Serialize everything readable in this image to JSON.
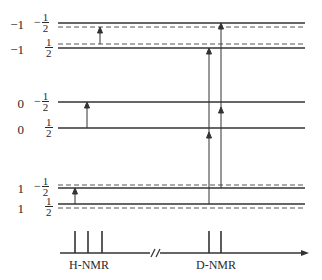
{
  "diagram": {
    "title": "",
    "levels": [
      {
        "mI": "-1",
        "mS_sign": "-",
        "mS_num": "1",
        "mS_den": "2",
        "y": 23
      },
      {
        "mI": "-1",
        "mS_sign": "",
        "mS_num": "1",
        "mS_den": "2",
        "y": 48
      },
      {
        "mI": "0",
        "mS_sign": "-",
        "mS_num": "1",
        "mS_den": "2",
        "y": 102
      },
      {
        "mI": "0",
        "mS_sign": "",
        "mS_num": "1",
        "mS_den": "2",
        "y": 128
      },
      {
        "mI": "1",
        "mS_sign": "-",
        "mS_num": "1",
        "mS_den": "2",
        "y": 188
      },
      {
        "mI": "1",
        "mS_sign": "",
        "mS_num": "1",
        "mS_den": "2",
        "y": 204
      }
    ],
    "dashed_levels_y": [
      26,
      44,
      185,
      208
    ],
    "transitions": {
      "h_nmr_arrows": [
        {
          "x": 100,
          "from": 44,
          "to": 26
        },
        {
          "x": 87,
          "from": 128,
          "to": 102
        },
        {
          "x": 75,
          "from": 204,
          "to": 188
        }
      ],
      "d_nmr_arrows": [
        {
          "x": 209,
          "from": 204,
          "to": 48
        },
        {
          "x": 221,
          "from": 188,
          "to": 23
        }
      ]
    },
    "spectrum": {
      "h_label": "H-NMR",
      "d_label": "D-NMR",
      "h_peaks_x": [
        75,
        88,
        102
      ],
      "d_peaks_x": [
        209,
        221
      ],
      "axis_break": "//"
    }
  }
}
